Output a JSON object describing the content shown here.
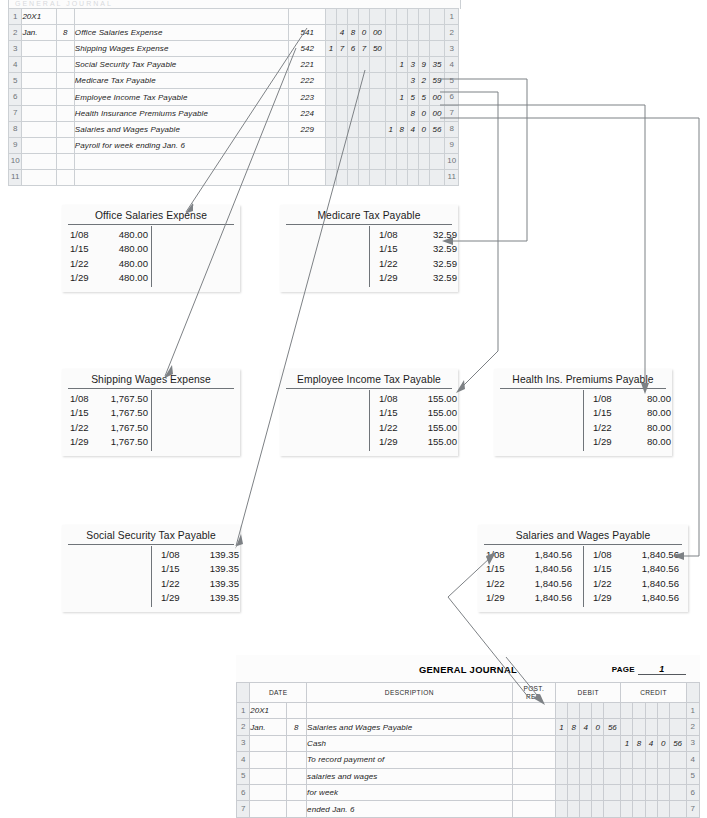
{
  "top_journal": {
    "name": "payroll-journal",
    "ghost_header": "GENERAL JOURNAL",
    "rows": [
      {
        "n": "1",
        "month": "20X1",
        "day": "",
        "desc": "",
        "indent": 0,
        "pr": "",
        "debit": "",
        "credit": ""
      },
      {
        "n": "2",
        "month": "Jan.",
        "day": "8",
        "desc": "Office Salaries Expense",
        "indent": 0,
        "pr": "541",
        "debit": "48000",
        "credit": ""
      },
      {
        "n": "3",
        "month": "",
        "day": "",
        "desc": "Shipping Wages Expense",
        "indent": 0,
        "pr": "542",
        "debit": "176750",
        "credit": ""
      },
      {
        "n": "4",
        "month": "",
        "day": "",
        "desc": "Social Security Tax Payable",
        "indent": 1,
        "pr": "221",
        "debit": "",
        "credit": "13935"
      },
      {
        "n": "5",
        "month": "",
        "day": "",
        "desc": "Medicare Tax Payable",
        "indent": 1,
        "pr": "222",
        "debit": "",
        "credit": "3259"
      },
      {
        "n": "6",
        "month": "",
        "day": "",
        "desc": "Employee Income Tax Payable",
        "indent": 1,
        "pr": "223",
        "debit": "",
        "credit": "15500"
      },
      {
        "n": "7",
        "month": "",
        "day": "",
        "desc": "Health Insurance Premiums Payable",
        "indent": 1,
        "pr": "224",
        "debit": "",
        "credit": "8000"
      },
      {
        "n": "8",
        "month": "",
        "day": "",
        "desc": "Salaries and Wages Payable",
        "indent": 1,
        "pr": "229",
        "debit": "",
        "credit": "184056"
      },
      {
        "n": "9",
        "month": "",
        "day": "",
        "desc": "Payroll for week ending Jan. 6",
        "indent": 2,
        "pr": "",
        "debit": "",
        "credit": ""
      },
      {
        "n": "10",
        "month": "",
        "day": "",
        "desc": "",
        "indent": 0,
        "pr": "",
        "debit": "",
        "credit": ""
      },
      {
        "n": "11",
        "month": "",
        "day": "",
        "desc": "",
        "indent": 0,
        "pr": "",
        "debit": "",
        "credit": ""
      }
    ]
  },
  "accounts": [
    {
      "id": "office-salaries-expense",
      "title": "Office Salaries Expense",
      "debit": [
        {
          "date": "1/08",
          "amount": "480.00"
        },
        {
          "date": "1/15",
          "amount": "480.00"
        },
        {
          "date": "1/22",
          "amount": "480.00"
        },
        {
          "date": "1/29",
          "amount": "480.00"
        }
      ],
      "credit": []
    },
    {
      "id": "medicare-tax-payable",
      "title": "Medicare Tax Payable",
      "debit": [],
      "credit": [
        {
          "date": "1/08",
          "amount": "32.59"
        },
        {
          "date": "1/15",
          "amount": "32.59"
        },
        {
          "date": "1/22",
          "amount": "32.59"
        },
        {
          "date": "1/29",
          "amount": "32.59"
        }
      ]
    },
    {
      "id": "shipping-wages-expense",
      "title": "Shipping Wages Expense",
      "debit": [
        {
          "date": "1/08",
          "amount": "1,767.50"
        },
        {
          "date": "1/15",
          "amount": "1,767.50"
        },
        {
          "date": "1/22",
          "amount": "1,767.50"
        },
        {
          "date": "1/29",
          "amount": "1,767.50"
        }
      ],
      "credit": []
    },
    {
      "id": "employee-income-tax-payable",
      "title": "Employee Income Tax Payable",
      "debit": [],
      "credit": [
        {
          "date": "1/08",
          "amount": "155.00"
        },
        {
          "date": "1/15",
          "amount": "155.00"
        },
        {
          "date": "1/22",
          "amount": "155.00"
        },
        {
          "date": "1/29",
          "amount": "155.00"
        }
      ]
    },
    {
      "id": "health-ins-premiums-payable",
      "title": "Health Ins. Premiums Payable",
      "debit": [],
      "credit": [
        {
          "date": "1/08",
          "amount": "80.00"
        },
        {
          "date": "1/15",
          "amount": "80.00"
        },
        {
          "date": "1/22",
          "amount": "80.00"
        },
        {
          "date": "1/29",
          "amount": "80.00"
        }
      ]
    },
    {
      "id": "social-security-tax-payable",
      "title": "Social Security Tax Payable",
      "debit": [],
      "credit": [
        {
          "date": "1/08",
          "amount": "139.35"
        },
        {
          "date": "1/15",
          "amount": "139.35"
        },
        {
          "date": "1/22",
          "amount": "139.35"
        },
        {
          "date": "1/29",
          "amount": "139.35"
        }
      ]
    },
    {
      "id": "salaries-and-wages-payable",
      "title": "Salaries and Wages Payable",
      "debit": [
        {
          "date": "1/08",
          "amount": "1,840.56"
        },
        {
          "date": "1/15",
          "amount": "1,840.56"
        },
        {
          "date": "1/22",
          "amount": "1,840.56"
        },
        {
          "date": "1/29",
          "amount": "1,840.56"
        }
      ],
      "credit": [
        {
          "date": "1/08",
          "amount": "1,840.56"
        },
        {
          "date": "1/15",
          "amount": "1,840.56"
        },
        {
          "date": "1/22",
          "amount": "1,840.56"
        },
        {
          "date": "1/29",
          "amount": "1,840.56"
        }
      ]
    }
  ],
  "general_journal": {
    "title": "GENERAL JOURNAL",
    "page_label": "PAGE",
    "page_number": "1",
    "headers": {
      "date": "DATE",
      "description": "DESCRIPTION",
      "post_ref_line1": "POST.",
      "post_ref_line2": "REF.",
      "debit": "DEBIT",
      "credit": "CREDIT"
    },
    "rows": [
      {
        "n": "1",
        "month": "20X1",
        "day": "",
        "desc": "",
        "indent": 0,
        "pr": "",
        "debit": "",
        "credit": ""
      },
      {
        "n": "2",
        "month": "Jan.",
        "day": "8",
        "desc": "Salaries and Wages Payable",
        "indent": 0,
        "pr": "",
        "debit": "184056",
        "credit": ""
      },
      {
        "n": "3",
        "month": "",
        "day": "",
        "desc": "Cash",
        "indent": 1,
        "pr": "",
        "debit": "",
        "credit": "184056"
      },
      {
        "n": "4",
        "month": "",
        "day": "",
        "desc": "To record payment of",
        "indent": 2,
        "pr": "",
        "debit": "",
        "credit": ""
      },
      {
        "n": "5",
        "month": "",
        "day": "",
        "desc": "salaries and wages",
        "indent": 2,
        "pr": "",
        "debit": "",
        "credit": ""
      },
      {
        "n": "6",
        "month": "",
        "day": "",
        "desc": "for week",
        "indent": 2,
        "pr": "",
        "debit": "",
        "credit": ""
      },
      {
        "n": "7",
        "month": "",
        "day": "",
        "desc": "ended Jan. 6",
        "indent": 2,
        "pr": "",
        "debit": "",
        "credit": ""
      }
    ]
  },
  "connectors": {
    "description": "posting reference arrows from journal lines to ledger T-accounts",
    "links": [
      {
        "from": "journal-line-2-debit",
        "to": "office-salaries-expense-debit"
      },
      {
        "from": "journal-line-3-debit",
        "to": "shipping-wages-expense-debit"
      },
      {
        "from": "journal-line-4-credit",
        "to": "social-security-tax-payable-credit"
      },
      {
        "from": "journal-line-5-credit",
        "to": "medicare-tax-payable-credit"
      },
      {
        "from": "journal-line-6-credit",
        "to": "employee-income-tax-payable-credit"
      },
      {
        "from": "journal-line-7-credit",
        "to": "health-ins-premiums-payable-credit"
      },
      {
        "from": "journal-line-8-credit",
        "to": "salaries-and-wages-payable-credit"
      },
      {
        "from": "general-journal-line-2-debit",
        "to": "salaries-and-wages-payable-debit"
      }
    ]
  },
  "colors": {
    "rule": "#6f7479",
    "grid": "#c9ccd1",
    "shade": "#eceef0",
    "wire": "#7d8185",
    "ink": "#1c1c1c"
  }
}
